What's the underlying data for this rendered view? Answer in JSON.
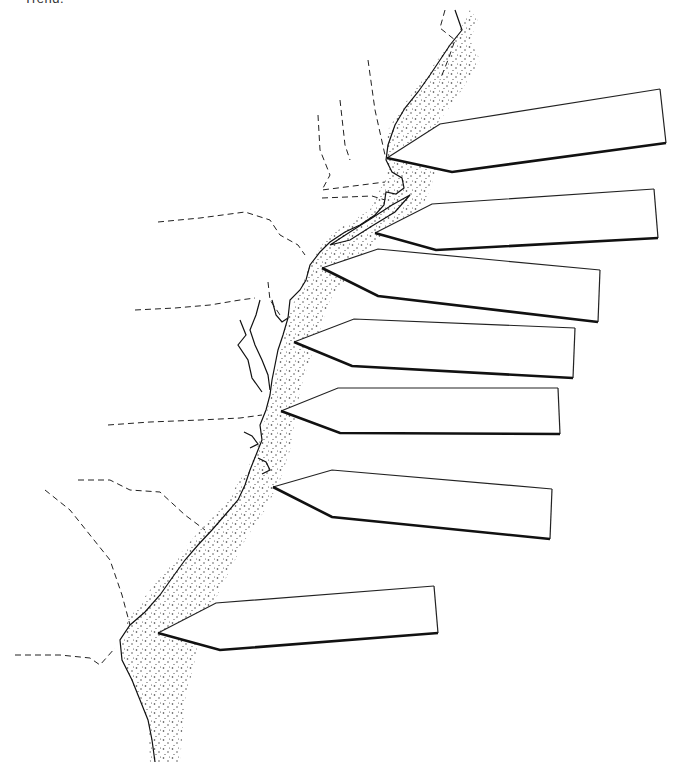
{
  "header": {
    "cut_off_text": "Trend."
  },
  "map": {
    "subject": "Atlantic coastline with continental shelf",
    "shelf_texture": "stipple",
    "state_borders": "dashed",
    "colors": {
      "ink": "#111111",
      "background": "#ffffff",
      "stipple": "#333333"
    }
  },
  "labels": [
    {
      "id": "label-1",
      "text": ""
    },
    {
      "id": "label-2",
      "text": ""
    },
    {
      "id": "label-3",
      "text": ""
    },
    {
      "id": "label-4",
      "text": ""
    },
    {
      "id": "label-5",
      "text": ""
    },
    {
      "id": "label-6",
      "text": ""
    },
    {
      "id": "label-7",
      "text": ""
    }
  ]
}
